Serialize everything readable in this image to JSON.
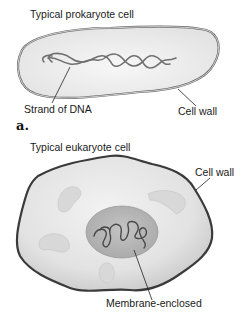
{
  "prokaryote": {
    "title": "Typical prokaryote cell",
    "labels": {
      "dna": "Strand of DNA",
      "wall": "Cell wall"
    },
    "panel_letter": "a."
  },
  "eukaryote": {
    "title": "Typical eukaryote cell",
    "labels": {
      "wall": "Cell wall",
      "nucleus": "Membrane-enclosed"
    }
  },
  "colors": {
    "cytoplasm": "#eeeeee",
    "cell_outline": "#555555",
    "dna": "#707070",
    "nucleus": "#b9b9b9",
    "organelle": "#d6d6d6",
    "text": "#1a1a1a"
  }
}
